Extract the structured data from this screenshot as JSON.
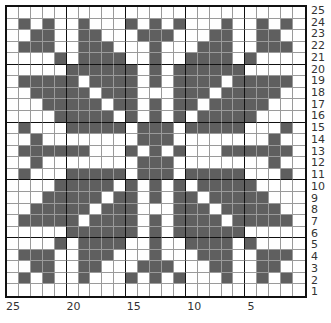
{
  "chart": {
    "title": "",
    "rows": 25,
    "cols": 25,
    "colors": {
      "dark": "#5f5f5f",
      "light": "#ffffff",
      "grid": "#9a9a9a",
      "border": "#111111"
    },
    "row_labels": [
      "25",
      "24",
      "23",
      "22",
      "21",
      "20",
      "19",
      "18",
      "17",
      "16",
      "15",
      "14",
      "13",
      "12",
      "11",
      "10",
      "9",
      "8",
      "7",
      "6",
      "5",
      "4",
      "3",
      "2",
      "1"
    ],
    "col_labels": [
      {
        "text": "25",
        "col_index": 0
      },
      {
        "text": "20",
        "col_index": 5
      },
      {
        "text": "15",
        "col_index": 10
      },
      {
        "text": "10",
        "col_index": 15
      },
      {
        "text": "5",
        "col_index": 20
      }
    ],
    "dark_cells_by_row": {
      "25": [],
      "24": [
        1,
        3,
        6,
        10,
        12,
        14,
        18,
        21,
        23
      ],
      "23": [
        2,
        3,
        6,
        7,
        11,
        12,
        13,
        17,
        18,
        21,
        22
      ],
      "22": [
        1,
        2,
        3,
        6,
        7,
        8,
        12,
        16,
        17,
        18,
        21,
        22,
        23
      ],
      "21": [
        4,
        6,
        7,
        8,
        9,
        12,
        15,
        16,
        17,
        18,
        20
      ],
      "20": [
        5,
        6,
        7,
        8,
        9,
        10,
        12,
        14,
        15,
        16,
        17,
        18,
        19
      ],
      "19": [
        1,
        2,
        3,
        4,
        5,
        7,
        8,
        9,
        10,
        12,
        14,
        15,
        16,
        17,
        19,
        20,
        21,
        22,
        23
      ],
      "18": [
        2,
        3,
        4,
        5,
        6,
        8,
        9,
        10,
        14,
        15,
        16,
        18,
        19,
        20,
        21,
        22
      ],
      "17": [
        3,
        4,
        5,
        6,
        7,
        9,
        10,
        12,
        14,
        15,
        17,
        18,
        19,
        20,
        21
      ],
      "16": [
        4,
        5,
        6,
        7,
        8,
        10,
        12,
        14,
        16,
        17,
        18,
        19,
        20
      ],
      "15": [
        1,
        5,
        6,
        7,
        8,
        9,
        11,
        12,
        13,
        15,
        16,
        17,
        18,
        19,
        23
      ],
      "14": [
        2,
        11,
        12,
        13,
        22
      ],
      "13": [
        1,
        2,
        3,
        4,
        5,
        6,
        10,
        12,
        14,
        18,
        19,
        20,
        21,
        22,
        23
      ],
      "12": [
        2,
        11,
        12,
        13,
        22
      ],
      "11": [
        1,
        5,
        6,
        7,
        8,
        9,
        11,
        12,
        13,
        15,
        16,
        17,
        18,
        19,
        23
      ],
      "10": [
        4,
        5,
        6,
        7,
        8,
        10,
        12,
        14,
        16,
        17,
        18,
        19,
        20
      ],
      "9": [
        3,
        4,
        5,
        6,
        7,
        9,
        10,
        12,
        14,
        15,
        17,
        18,
        19,
        20,
        21
      ],
      "8": [
        2,
        3,
        4,
        5,
        6,
        8,
        9,
        10,
        14,
        15,
        16,
        18,
        19,
        20,
        21,
        22
      ],
      "7": [
        1,
        2,
        3,
        4,
        5,
        7,
        8,
        9,
        10,
        12,
        14,
        15,
        16,
        17,
        19,
        20,
        21,
        22,
        23
      ],
      "6": [
        5,
        6,
        7,
        8,
        9,
        10,
        12,
        14,
        15,
        16,
        17,
        18,
        19
      ],
      "5": [
        4,
        6,
        7,
        8,
        9,
        12,
        15,
        16,
        17,
        18,
        20
      ],
      "4": [
        1,
        2,
        3,
        6,
        7,
        8,
        12,
        16,
        17,
        18,
        21,
        22,
        23
      ],
      "3": [
        2,
        3,
        6,
        7,
        11,
        12,
        13,
        17,
        18,
        21,
        22
      ],
      "2": [
        1,
        3,
        6,
        10,
        12,
        14,
        18,
        21,
        23
      ],
      "1": []
    }
  }
}
